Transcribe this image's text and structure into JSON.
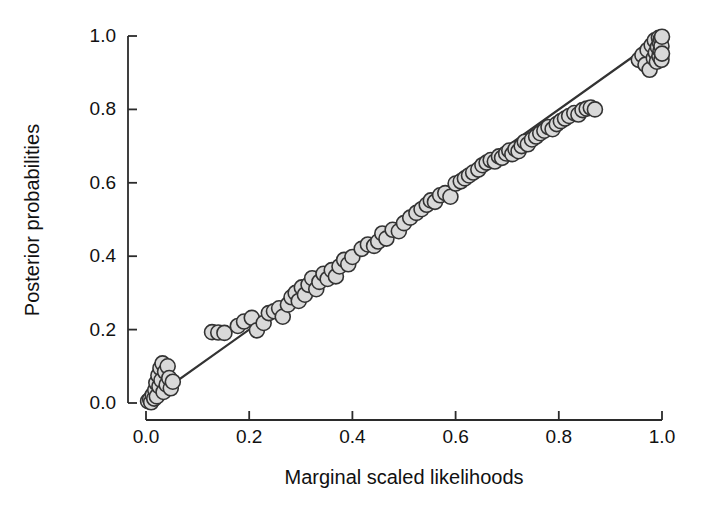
{
  "chart_data": {
    "type": "scatter",
    "title": "",
    "xlabel": "Marginal scaled likelihoods",
    "ylabel": "Posterior probabilities",
    "xlim": [
      0.0,
      1.0
    ],
    "ylim": [
      0.0,
      1.0
    ],
    "xticks": [
      "0.0",
      "0.2",
      "0.4",
      "0.6",
      "0.8",
      "1.0"
    ],
    "xtick_values": [
      0.0,
      0.2,
      0.4,
      0.6,
      0.8,
      1.0
    ],
    "yticks": [
      "0.0",
      "0.2",
      "0.4",
      "0.6",
      "0.8",
      "1.0"
    ],
    "ytick_values": [
      0.0,
      0.2,
      0.4,
      0.6,
      0.8,
      1.0
    ],
    "grid": false,
    "legend": null,
    "marker": {
      "shape": "circle",
      "fill_color": "#d9d9d9",
      "edge_color": "#333333",
      "diameter_px": 15,
      "edge_width_px": 1.6
    },
    "reference_line": {
      "name": "identity-line",
      "type": "line",
      "x": [
        0.0,
        1.0
      ],
      "y": [
        0.0,
        1.0
      ],
      "color": "#333333",
      "width_px": 2.2,
      "description": "one-to-one diagonal"
    },
    "series": [
      {
        "name": "nodes",
        "point_count": 120,
        "points": [
          [
            0.004,
            0.005
          ],
          [
            0.008,
            0.01
          ],
          [
            0.01,
            0.002
          ],
          [
            0.013,
            0.022
          ],
          [
            0.016,
            0.012
          ],
          [
            0.018,
            0.035
          ],
          [
            0.02,
            0.055
          ],
          [
            0.021,
            0.018
          ],
          [
            0.024,
            0.075
          ],
          [
            0.026,
            0.045
          ],
          [
            0.028,
            0.095
          ],
          [
            0.03,
            0.062
          ],
          [
            0.032,
            0.108
          ],
          [
            0.034,
            0.03
          ],
          [
            0.037,
            0.085
          ],
          [
            0.04,
            0.05
          ],
          [
            0.042,
            0.1
          ],
          [
            0.045,
            0.068
          ],
          [
            0.048,
            0.04
          ],
          [
            0.052,
            0.058
          ],
          [
            0.128,
            0.193
          ],
          [
            0.14,
            0.192
          ],
          [
            0.152,
            0.191
          ],
          [
            0.178,
            0.21
          ],
          [
            0.19,
            0.222
          ],
          [
            0.205,
            0.232
          ],
          [
            0.215,
            0.198
          ],
          [
            0.228,
            0.218
          ],
          [
            0.238,
            0.245
          ],
          [
            0.248,
            0.25
          ],
          [
            0.258,
            0.258
          ],
          [
            0.265,
            0.235
          ],
          [
            0.275,
            0.268
          ],
          [
            0.282,
            0.288
          ],
          [
            0.29,
            0.3
          ],
          [
            0.296,
            0.278
          ],
          [
            0.302,
            0.315
          ],
          [
            0.308,
            0.295
          ],
          [
            0.315,
            0.322
          ],
          [
            0.322,
            0.34
          ],
          [
            0.33,
            0.31
          ],
          [
            0.336,
            0.33
          ],
          [
            0.344,
            0.352
          ],
          [
            0.352,
            0.338
          ],
          [
            0.36,
            0.362
          ],
          [
            0.368,
            0.345
          ],
          [
            0.375,
            0.372
          ],
          [
            0.384,
            0.39
          ],
          [
            0.392,
            0.378
          ],
          [
            0.4,
            0.398
          ],
          [
            0.418,
            0.42
          ],
          [
            0.43,
            0.432
          ],
          [
            0.442,
            0.428
          ],
          [
            0.45,
            0.44
          ],
          [
            0.458,
            0.462
          ],
          [
            0.466,
            0.448
          ],
          [
            0.478,
            0.472
          ],
          [
            0.49,
            0.468
          ],
          [
            0.5,
            0.49
          ],
          [
            0.512,
            0.505
          ],
          [
            0.524,
            0.518
          ],
          [
            0.534,
            0.528
          ],
          [
            0.544,
            0.54
          ],
          [
            0.552,
            0.552
          ],
          [
            0.56,
            0.548
          ],
          [
            0.57,
            0.566
          ],
          [
            0.58,
            0.572
          ],
          [
            0.59,
            0.562
          ],
          [
            0.6,
            0.598
          ],
          [
            0.61,
            0.604
          ],
          [
            0.618,
            0.612
          ],
          [
            0.626,
            0.62
          ],
          [
            0.634,
            0.628
          ],
          [
            0.644,
            0.636
          ],
          [
            0.652,
            0.648
          ],
          [
            0.66,
            0.655
          ],
          [
            0.668,
            0.662
          ],
          [
            0.676,
            0.658
          ],
          [
            0.684,
            0.672
          ],
          [
            0.69,
            0.668
          ],
          [
            0.698,
            0.68
          ],
          [
            0.704,
            0.688
          ],
          [
            0.71,
            0.678
          ],
          [
            0.716,
            0.692
          ],
          [
            0.722,
            0.686
          ],
          [
            0.728,
            0.7
          ],
          [
            0.734,
            0.712
          ],
          [
            0.74,
            0.705
          ],
          [
            0.748,
            0.718
          ],
          [
            0.756,
            0.726
          ],
          [
            0.764,
            0.735
          ],
          [
            0.772,
            0.742
          ],
          [
            0.78,
            0.752
          ],
          [
            0.788,
            0.746
          ],
          [
            0.796,
            0.76
          ],
          [
            0.804,
            0.768
          ],
          [
            0.812,
            0.775
          ],
          [
            0.82,
            0.782
          ],
          [
            0.83,
            0.79
          ],
          [
            0.838,
            0.786
          ],
          [
            0.846,
            0.798
          ],
          [
            0.854,
            0.802
          ],
          [
            0.862,
            0.805
          ],
          [
            0.87,
            0.8
          ],
          [
            0.955,
            0.935
          ],
          [
            0.962,
            0.948
          ],
          [
            0.968,
            0.922
          ],
          [
            0.972,
            0.962
          ],
          [
            0.976,
            0.908
          ],
          [
            0.98,
            0.975
          ],
          [
            0.984,
            0.94
          ],
          [
            0.986,
            0.988
          ],
          [
            0.988,
            0.955
          ],
          [
            0.99,
            0.93
          ],
          [
            0.992,
            0.97
          ],
          [
            0.994,
            0.995
          ],
          [
            0.995,
            0.945
          ],
          [
            0.996,
            0.982
          ],
          [
            0.997,
            0.96
          ],
          [
            0.998,
            0.992
          ],
          [
            0.999,
            0.972
          ],
          [
            0.999,
            0.935
          ],
          [
            1.0,
            0.998
          ],
          [
            1.0,
            0.952
          ]
        ]
      }
    ]
  },
  "axes": {
    "x_axis_name": "x-axis",
    "y_axis_name": "y-axis"
  }
}
